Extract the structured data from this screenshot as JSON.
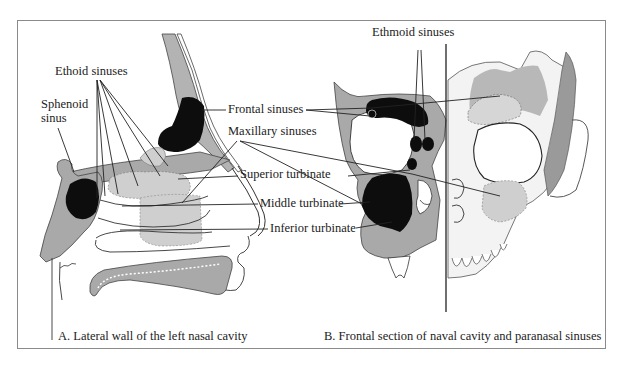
{
  "figure": {
    "panels": [
      {
        "id": "A",
        "caption": "A. Lateral wall of the left nasal cavity",
        "labels": {
          "ethoid": "Ethoid sinuses",
          "sphenoid_1": "Sphenoid",
          "sphenoid_2": "sinus",
          "frontal": "Frontal sinuses",
          "maxillary": "Maxillary sinuses",
          "superior": "Superior turbinate",
          "middle": "Middle turbinate",
          "inferior": "Inferior turbinate"
        }
      },
      {
        "id": "B",
        "caption": "B. Frontal section of naval cavity and paranasal sinuses",
        "labels": {
          "ethmoid": "Ethmoid sinuses"
        }
      }
    ],
    "colors": {
      "bone_gray": "#a9a9a9",
      "sinus_black": "#0d0d0d",
      "tissue_light": "#cfcfcf",
      "line": "#222222",
      "frame": "#8a8a8a"
    }
  }
}
